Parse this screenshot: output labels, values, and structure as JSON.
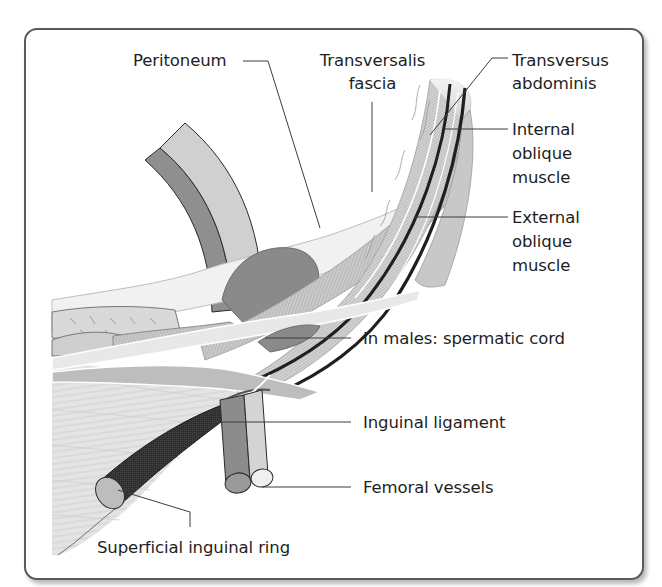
{
  "diagram": {
    "title": "",
    "labels": {
      "peritoneum": "Peritoneum",
      "transversalis_fascia_1": "Transversalis",
      "transversalis_fascia_2": "fascia",
      "transversus_abdominis_1": "Transversus",
      "transversus_abdominis_2": "abdominis",
      "internal_oblique_1": "Internal",
      "internal_oblique_2": "oblique",
      "internal_oblique_3": "muscle",
      "external_oblique_1": "External",
      "external_oblique_2": "oblique",
      "external_oblique_3": "muscle",
      "spermatic_cord": "In males: spermatic cord",
      "inguinal_ligament": "Inguinal ligament",
      "femoral_vessels": "Femoral vessels",
      "superficial_inguinal_ring": "Superficial inguinal ring"
    },
    "colors": {
      "frame": "#5a5a5a",
      "leader_line": "#3c3c3c",
      "vessel_dark": "#8c8c8c",
      "vessel_light": "#d2d2d2",
      "cord_dark": "#2e2e2e",
      "tissue_light": "#e6e6e6",
      "tissue_mid": "#bdbdbd"
    }
  }
}
